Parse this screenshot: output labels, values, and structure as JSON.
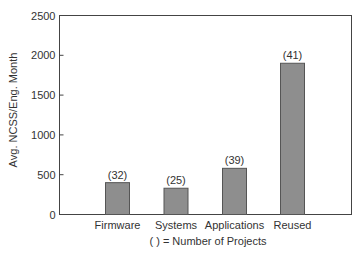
{
  "chart_data": {
    "type": "bar",
    "title": "",
    "xlabel": "( ) = Number of Projects",
    "ylabel": "Avg. NCSS/Eng. Month",
    "categories": [
      "Firmware",
      "Systems",
      "Applications",
      "Reused"
    ],
    "values": [
      400,
      330,
      580,
      1900
    ],
    "bar_labels": [
      "(32)",
      "(25)",
      "(39)",
      "(41)"
    ],
    "ylim": [
      0,
      2500
    ],
    "yticks": [
      0,
      500,
      1000,
      1500,
      2000,
      2500
    ],
    "grid": false,
    "legend": null,
    "colors": {
      "bar_fill": "#8e8e8e",
      "bar_edge": "#555555",
      "axis": "#444444"
    }
  }
}
